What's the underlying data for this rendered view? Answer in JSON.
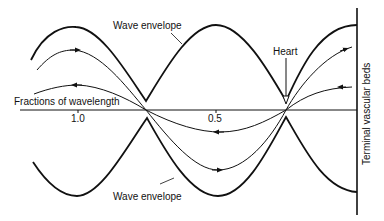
{
  "diagram": {
    "labels": {
      "envelope_top": "Wave envelope",
      "envelope_bottom": "Wave envelope",
      "heart": "Heart",
      "axis": "Fractions of wavelength",
      "tick_1": "1.0",
      "tick_2": "0.5",
      "terminal": "Terminal vascular beds"
    },
    "colors": {
      "stroke": "#111111",
      "background": "#ffffff"
    }
  }
}
